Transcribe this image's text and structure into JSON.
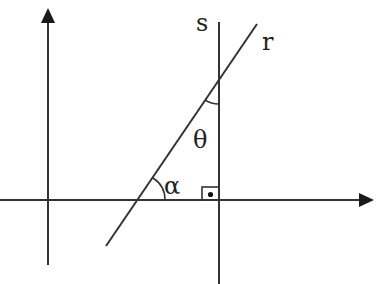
{
  "diagram": {
    "type": "geometry",
    "colors": {
      "stroke": "#333333",
      "background": "#ffffff"
    },
    "axes": {
      "x_axis": {
        "y": 200,
        "x_start": 0,
        "x_end": 374,
        "arrow": true
      },
      "y_axis": {
        "x": 48,
        "y_start": 265,
        "y_end": 8,
        "arrow": true
      }
    },
    "lines": [
      {
        "name": "r",
        "label": "r",
        "from": [
          106,
          246
        ],
        "to": [
          257,
          24
        ]
      },
      {
        "name": "s",
        "label": "s",
        "from": [
          219,
          22
        ],
        "to": [
          219,
          284
        ]
      }
    ],
    "angles": [
      {
        "label": "α",
        "description": "angle between line r and x-axis"
      },
      {
        "label": "θ",
        "description": "angle between line r and line s"
      }
    ],
    "right_angle_marker": {
      "between": [
        "s",
        "x-axis"
      ]
    },
    "labels": {
      "s": "s",
      "r": "r",
      "alpha": "α",
      "theta": "θ"
    }
  }
}
